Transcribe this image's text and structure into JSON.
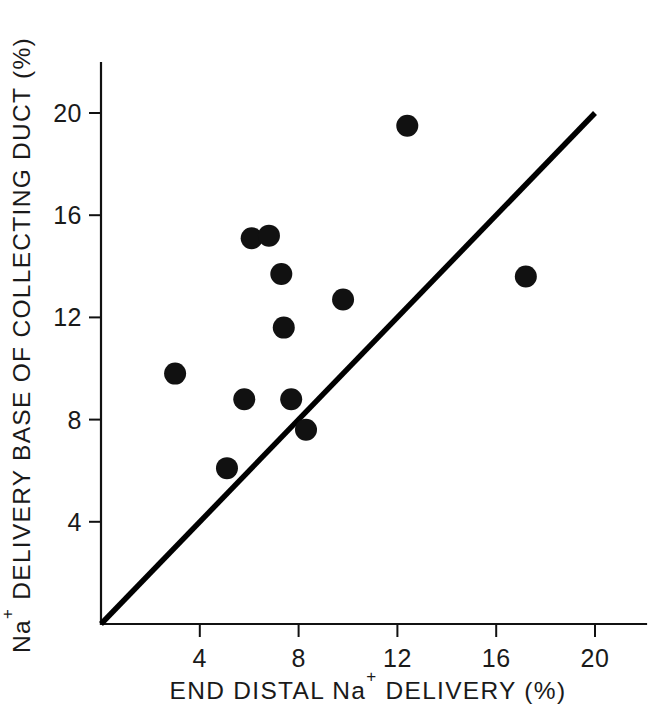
{
  "chart_data": {
    "type": "scatter",
    "title": "",
    "xlabel": "END DISTAL Na+ DELIVERY (%)",
    "xlabel_parts": {
      "pre": "END DISTAL Na",
      "sup": "+",
      "post": " DELIVERY (%)"
    },
    "ylabel": "Na+ DELIVERY BASE OF COLLECTING DUCT (%)",
    "ylabel_parts": {
      "pre": "Na",
      "sup": "+",
      "post": " DELIVERY BASE OF COLLECTING DUCT (%)"
    },
    "xlim": [
      0,
      22
    ],
    "ylim": [
      0,
      22.5
    ],
    "xticks": [
      4,
      8,
      12,
      16,
      20
    ],
    "xtick_labels": [
      "4",
      "8",
      "12",
      "16",
      "20"
    ],
    "yticks": [
      4,
      8,
      12,
      16,
      20
    ],
    "ytick_labels": [
      "4",
      "8",
      "12",
      "16",
      "20"
    ],
    "grid": false,
    "legend": false,
    "marker_color": "#111111",
    "marker_radius_px": 11,
    "line_color": "#000000",
    "reference_line": {
      "name": "line of identity",
      "from": [
        0,
        0
      ],
      "to": [
        20,
        20
      ]
    },
    "points": [
      {
        "x": 3.0,
        "y": 9.8
      },
      {
        "x": 5.1,
        "y": 6.1
      },
      {
        "x": 5.8,
        "y": 8.8
      },
      {
        "x": 6.1,
        "y": 15.1
      },
      {
        "x": 6.8,
        "y": 15.2
      },
      {
        "x": 7.3,
        "y": 13.7
      },
      {
        "x": 7.4,
        "y": 11.6
      },
      {
        "x": 7.7,
        "y": 8.8
      },
      {
        "x": 8.3,
        "y": 7.6
      },
      {
        "x": 9.8,
        "y": 12.7
      },
      {
        "x": 12.4,
        "y": 19.5
      },
      {
        "x": 17.2,
        "y": 13.6
      }
    ],
    "n_points": 12
  }
}
